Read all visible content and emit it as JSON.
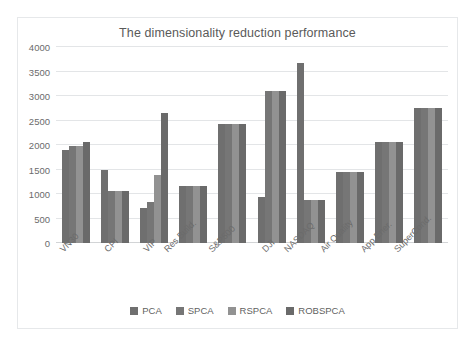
{
  "chart_data": {
    "type": "bar",
    "title": "The dimensionality reduction performance",
    "xlabel": "",
    "ylabel": "",
    "ylim": [
      0,
      4000
    ],
    "yticks": [
      0,
      500,
      1000,
      1500,
      2000,
      2500,
      3000,
      3500,
      4000
    ],
    "grid": true,
    "legend_position": "bottom",
    "categories": [
      "VN30",
      "CPI",
      "VIP",
      "Res.Build.",
      "S&P500",
      "DJI",
      "NASDAQ",
      "Air Quality",
      "App.Ener.",
      "SuperCond."
    ],
    "series": [
      {
        "name": "PCA",
        "color": "#6f6f6f",
        "values": [
          1900,
          1490,
          720,
          1160,
          2430,
          935,
          3680,
          1450,
          2055,
          2755
        ]
      },
      {
        "name": "SPCA",
        "color": "#767676",
        "values": [
          1975,
          1060,
          835,
          1160,
          2430,
          3105,
          870,
          1450,
          2055,
          2755
        ]
      },
      {
        "name": "RSPCA",
        "color": "#929292",
        "values": [
          1975,
          1060,
          1385,
          1160,
          2430,
          3105,
          870,
          1450,
          2055,
          2755
        ]
      },
      {
        "name": "ROBSPCA",
        "color": "#6a6a6a",
        "values": [
          2060,
          1065,
          2655,
          1160,
          2430,
          3105,
          875,
          1450,
          2055,
          2755
        ]
      }
    ]
  },
  "colors": {
    "frame_border": "#e6e8ea",
    "gridline": "#e3e5e7",
    "baseline": "#d2d4d6",
    "tick_text": "#6b6b6b",
    "title_text": "#5a5a5a",
    "legend_text": "#5f5f5f",
    "background": "#ffffff"
  }
}
